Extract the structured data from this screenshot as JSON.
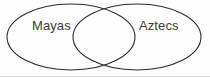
{
  "diagram": {
    "kind": "venn-diagram",
    "title": "",
    "background_color": "#fdfdfd",
    "stroke_color": "#2b2b2b",
    "text_color": "#3b3b3b",
    "baseline_color": "#d8d8d8",
    "sets": [
      {
        "id": "left",
        "label": "Mayas",
        "shape": "ellipse",
        "cx": 71,
        "cy": 37,
        "rx": 64,
        "ry": 33
      },
      {
        "id": "right",
        "label": "Aztecs",
        "shape": "ellipse",
        "cx": 137,
        "cy": 37,
        "rx": 64,
        "ry": 33
      }
    ],
    "intersection": {
      "label": "",
      "left_bound_x": 73,
      "right_bound_x": 135
    }
  }
}
